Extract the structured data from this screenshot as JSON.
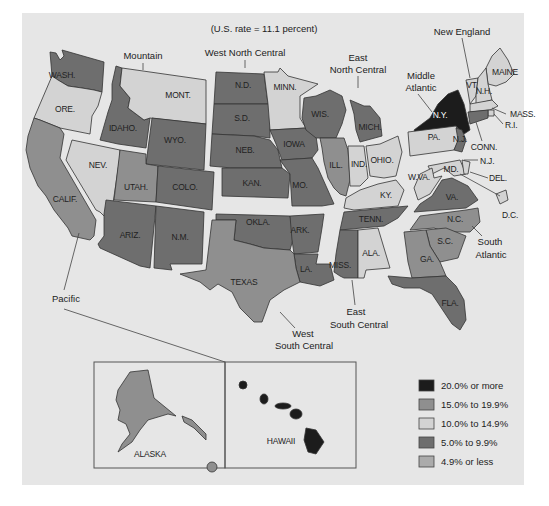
{
  "title": "(U.S. rate = 11.1 percent)",
  "colors": {
    "panel_bg": "#e6e6e6",
    "c20plus": "#1c1c1c",
    "c15to19": "#8f8f8f",
    "c10to14": "#d3d3d3",
    "c5to9": "#6e6e6e",
    "c4less": "#ababab"
  },
  "legend": [
    {
      "key": "c20plus",
      "label": "20.0% or more"
    },
    {
      "key": "c15to19",
      "label": "15.0% to 19.9%"
    },
    {
      "key": "c10to14",
      "label": "10.0% to 14.9%"
    },
    {
      "key": "c5to9",
      "label": "5.0% to 9.9%"
    },
    {
      "key": "c4less",
      "label": "4.9% or less"
    }
  ],
  "regions": {
    "pacific": "Pacific",
    "mountain": "Mountain",
    "west_north_central": "West North Central",
    "east_north_central_1": "East",
    "east_north_central_2": "North Central",
    "middle_atlantic_1": "Middle",
    "middle_atlantic_2": "Atlantic",
    "new_england": "New England",
    "south_atlantic_1": "South",
    "south_atlantic_2": "Atlantic",
    "east_south_central_1": "East",
    "east_south_central_2": "South Central",
    "west_south_central_1": "West",
    "west_south_central_2": "South Central"
  },
  "chart_data": {
    "type": "choropleth",
    "title": "(U.S. rate = 11.1 percent)",
    "us_rate_percent": 11.1,
    "legend_position": "bottom-right",
    "bins": [
      "20.0% or more",
      "15.0% to 19.9%",
      "10.0% to 14.9%",
      "5.0% to 9.9%",
      "4.9% or less"
    ],
    "states": {
      "WASH.": "5.0% to 9.9%",
      "ORE.": "10.0% to 14.9%",
      "CALIF.": "15.0% to 19.9%",
      "NEV.": "10.0% to 14.9%",
      "IDAHO.": "5.0% to 9.9%",
      "MONT.": "10.0% to 14.9%",
      "WYO.": "5.0% to 9.9%",
      "UTAH.": "15.0% to 19.9%",
      "COLO.": "5.0% to 9.9%",
      "ARIZ.": "5.0% to 9.9%",
      "N.M.": "5.0% to 9.9%",
      "N.D.": "5.0% to 9.9%",
      "S.D.": "5.0% to 9.9%",
      "NEB.": "5.0% to 9.9%",
      "KAN.": "5.0% to 9.9%",
      "MINN.": "10.0% to 14.9%",
      "IOWA": "5.0% to 9.9%",
      "MO.": "5.0% to 9.9%",
      "OKLA.": "5.0% to 9.9%",
      "ARK.": "5.0% to 9.9%",
      "LA.": "5.0% to 9.9%",
      "TEXAS": "15.0% to 19.9%",
      "WIS.": "5.0% to 9.9%",
      "MICH.": "5.0% to 9.9%",
      "ILL.": "15.0% to 19.9%",
      "IND.": "10.0% to 14.9%",
      "OHIO.": "10.0% to 14.9%",
      "KY.": "10.0% to 14.9%",
      "TENN.": "5.0% to 9.9%",
      "MISS.": "5.0% to 9.9%",
      "ALA.": "10.0% to 14.9%",
      "N.Y.": "20.0% or more",
      "PA.": "10.0% to 14.9%",
      "N.J.": "5.0% to 9.9%",
      "MAINE": "10.0% to 14.9%",
      "VT.": "10.0% to 14.9%",
      "N.H.": "10.0% to 14.9%",
      "MASS.": "10.0% to 14.9%",
      "R.I.": "10.0% to 14.9%",
      "CONN.": "5.0% to 9.9%",
      "MD.": "10.0% to 14.9%",
      "DEL.": "10.0% to 14.9%",
      "D.C.": "10.0% to 14.9%",
      "W.VA.": "10.0% to 14.9%",
      "VA.": "5.0% to 9.9%",
      "N.C.": "15.0% to 19.9%",
      "S.C.": "15.0% to 19.9%",
      "GA.": "15.0% to 19.9%",
      "FLA.": "5.0% to 9.9%",
      "ALASKA": "15.0% to 19.9%",
      "HAWAII": "20.0% or more"
    }
  },
  "states": [
    {
      "id": "wash",
      "label": "WASH.",
      "fill": "c5to9",
      "lx": 62,
      "ly": 78,
      "pts": "50,52 56,53 60,60 64,56 62,50 104,62 102,92 94,90 82,88 68,86 58,80 52,76"
    },
    {
      "id": "ore",
      "label": "ORE.",
      "fill": "c10to14",
      "lx": 65,
      "ly": 112,
      "pts": "52,76 58,80 68,86 82,88 94,90 102,92 98,106 92,116 90,134 60,128 40,120 34,118 40,104 46,90"
    },
    {
      "id": "calif",
      "label": "CALIF.",
      "fill": "c15to19",
      "lx": 65,
      "ly": 202,
      "pts": "34,118 40,120 60,128 64,134 60,158 96,220 94,236 90,240 72,236 68,228 54,210 46,196 38,186 30,168 26,150 28,136"
    },
    {
      "id": "nev",
      "label": "NEV.",
      "fill": "c10to14",
      "lx": 98,
      "ly": 168,
      "pts": "72,140 120,150 120,156 112,210 108,214 104,216 100,212 96,210 66,160"
    },
    {
      "id": "idaho",
      "label": "IDAHO.",
      "fill": "c5to9",
      "lx": 123,
      "ly": 131,
      "pts": "116,66 122,68 120,86 130,98 128,108 144,120 150,118 146,148 118,144 100,140 104,126 108,112 112,100 112,84"
    },
    {
      "id": "mont",
      "label": "MONT.",
      "fill": "c10to14",
      "lx": 178,
      "ly": 98,
      "pts": "122,68 206,80 206,124 150,118 144,120 128,108 130,98 120,86"
    },
    {
      "id": "wyo",
      "label": "WYO.",
      "fill": "c5to9",
      "lx": 175,
      "ly": 143,
      "pts": "152,118 206,124 204,170 146,164"
    },
    {
      "id": "utah",
      "label": "UTAH.",
      "fill": "c15to19",
      "lx": 136,
      "ly": 190,
      "pts": "120,150 146,154 146,164 158,166 156,202 114,200"
    },
    {
      "id": "colo",
      "label": "COLO.",
      "fill": "c5to9",
      "lx": 185,
      "ly": 190,
      "pts": "158,166 214,172 212,210 156,202"
    },
    {
      "id": "ariz",
      "label": "ARIZ.",
      "fill": "c5to9",
      "lx": 130,
      "ly": 238,
      "pts": "106,200 156,206 150,268 140,266 100,248 98,244 104,236 104,214"
    },
    {
      "id": "nm",
      "label": "N.M.",
      "fill": "c5to9",
      "lx": 180,
      "ly": 240,
      "pts": "156,206 204,212 202,264 170,264 172,270 154,268"
    },
    {
      "id": "nd",
      "label": "N.D.",
      "fill": "c5to9",
      "lx": 243,
      "ly": 88,
      "pts": "216,72 264,74 268,104 214,104"
    },
    {
      "id": "sd",
      "label": "S.D.",
      "fill": "c5to9",
      "lx": 242,
      "ly": 121,
      "pts": "214,104 270,104 270,138 254,136 212,134"
    },
    {
      "id": "neb",
      "label": "NEB.",
      "fill": "c5to9",
      "lx": 245,
      "ly": 153,
      "pts": "212,134 254,136 270,140 278,150 282,168 232,168 210,166"
    },
    {
      "id": "kan",
      "label": "KAN.",
      "fill": "c5to9",
      "lx": 252,
      "ly": 186,
      "pts": "222,168 282,168 290,174 288,198 222,196"
    },
    {
      "id": "minn",
      "label": "MINN.",
      "fill": "c10to14",
      "lx": 285,
      "ly": 90,
      "pts": "264,72 278,72 280,68 288,76 318,84 300,96 300,118 306,128 270,130 268,104"
    },
    {
      "id": "iowa",
      "label": "IOWA",
      "fill": "c5to9",
      "lx": 294,
      "ly": 147,
      "pts": "270,130 306,128 316,136 318,150 312,158 282,160 276,144"
    },
    {
      "id": "mo",
      "label": "MO.",
      "fill": "c5to9",
      "lx": 300,
      "ly": 188,
      "pts": "280,160 312,158 318,168 326,186 334,204 322,206 292,206 290,174"
    },
    {
      "id": "okla",
      "label": "OKLA.",
      "fill": "c5to9",
      "lx": 258,
      "ly": 225,
      "pts": "216,214 290,216 294,236 290,250 264,248 250,244 234,240 236,220 216,220"
    },
    {
      "id": "ark",
      "label": "ARK.",
      "fill": "c5to9",
      "lx": 300,
      "ly": 233,
      "pts": "290,216 324,214 322,228 318,252 294,254 292,240"
    },
    {
      "id": "la",
      "label": "LA.",
      "fill": "c5to9",
      "lx": 306,
      "ly": 272,
      "pts": "294,254 318,254 316,264 330,264 334,280 320,286 300,282 296,268"
    },
    {
      "id": "texas",
      "label": "TEXAS",
      "fill": "c15to19",
      "lx": 244,
      "ly": 285,
      "pts": "212,220 236,220 234,240 250,244 264,248 290,250 294,254 296,268 300,282 284,290 270,300 262,322 254,322 240,308 232,292 218,284 210,290 200,282 180,274 206,270"
    },
    {
      "id": "wis",
      "label": "WIS.",
      "fill": "c5to9",
      "lx": 320,
      "ly": 117,
      "pts": "304,98 316,96 330,90 342,96 346,110 342,124 336,138 316,138 306,130 302,118"
    },
    {
      "id": "mich",
      "label": "MICH.",
      "fill": "c5to9",
      "lx": 370,
      "ly": 130,
      "pts": "350,100 364,106 370,106 380,118 382,136 360,142 356,130 354,114"
    },
    {
      "id": "ill",
      "label": "ILL.",
      "fill": "c15to19",
      "lx": 336,
      "ly": 168,
      "pts": "320,138 344,138 348,150 350,180 346,196 340,194 334,188 328,178 324,162 322,148"
    },
    {
      "id": "ind",
      "label": "IND.",
      "fill": "c10to14",
      "lx": 359,
      "ly": 167,
      "pts": "348,146 364,146 368,178 360,186 350,186"
    },
    {
      "id": "ohio",
      "label": "OHIO.",
      "fill": "c10to14",
      "lx": 382,
      "ly": 163,
      "pts": "366,146 380,144 398,136 402,152 396,176 384,178 370,176"
    },
    {
      "id": "ky",
      "label": "KY.",
      "fill": "c10to14",
      "lx": 386,
      "ly": 198,
      "pts": "346,198 360,190 378,184 396,180 404,190 398,206 354,210 344,208"
    },
    {
      "id": "tenn",
      "label": "TENN.",
      "fill": "c5to9",
      "lx": 371,
      "ly": 222,
      "pts": "344,212 408,206 398,218 384,226 340,230"
    },
    {
      "id": "miss",
      "label": "MISS.",
      "fill": "c5to9",
      "lx": 340,
      "ly": 268,
      "pts": "340,230 358,230 358,278 344,278 340,276 334,272 336,254"
    },
    {
      "id": "ala",
      "label": "ALA.",
      "fill": "c10to14",
      "lx": 371,
      "ly": 256,
      "pts": "358,230 378,228 390,268 366,270 364,278 358,278"
    },
    {
      "id": "ny",
      "label": "N.Y.",
      "fill": "c20plus",
      "lx": 440,
      "ly": 118,
      "pts": "414,130 430,118 438,104 448,94 458,90 464,104 470,130 464,134 456,126 416,134"
    },
    {
      "id": "pa",
      "label": "PA.",
      "fill": "c10to14",
      "lx": 434,
      "ly": 140,
      "pts": "408,132 456,126 460,138 454,150 410,156"
    },
    {
      "id": "nj",
      "label": "N.J.",
      "fill": "c5to9",
      "lx": 460,
      "ly": 142,
      "pts": "456,128 462,130 466,140 462,152 454,150 458,140"
    },
    {
      "id": "maine",
      "label": "MAINE",
      "fill": "c10to14",
      "lx": 505,
      "ly": 75,
      "pts": "492,56 500,48 508,60 514,74 506,82 496,86 488,84 486,68"
    },
    {
      "id": "vt",
      "label": "VT.",
      "fill": "c10to14",
      "lx": 472,
      "ly": 88,
      "pts": "466,80 478,78 476,96 470,104 468,92"
    },
    {
      "id": "nh",
      "label": "N.H.",
      "fill": "c10to14",
      "lx": 484,
      "ly": 94,
      "pts": "478,78 486,68 488,84 492,100 476,104 476,96"
    },
    {
      "id": "mass",
      "label": "MASS.",
      "fill": "c10to14",
      "lx": 0,
      "ly": 0,
      "pts": "470,104 492,100 498,106 490,110 470,112"
    },
    {
      "id": "ri",
      "label": "R.I.",
      "fill": "c10to14",
      "lx": 0,
      "ly": 0,
      "pts": "488,110 494,110 494,116 488,116"
    },
    {
      "id": "conn",
      "label": "CONN.",
      "fill": "c5to9",
      "lx": 0,
      "ly": 0,
      "pts": "468,112 488,110 488,118 470,124"
    },
    {
      "id": "md",
      "label": "MD.",
      "fill": "c10to14",
      "lx": 0,
      "ly": 0,
      "pts": "428,166 460,160 466,174 454,176 444,168 432,174"
    },
    {
      "id": "del",
      "label": "DEL.",
      "fill": "c10to14",
      "lx": 0,
      "ly": 0,
      "pts": "462,160 470,162 468,174 464,174"
    },
    {
      "id": "dc",
      "label": "D.C.",
      "fill": "c10to14",
      "lx": 0,
      "ly": 0,
      "pts": "496,194 506,190 508,200 500,204"
    },
    {
      "id": "wva",
      "label": "W.VA.",
      "fill": "c10to14",
      "lx": 0,
      "ly": 0,
      "pts": "420,174 432,168 434,178 442,176 430,194 418,200 414,188"
    },
    {
      "id": "va",
      "label": "VA.",
      "fill": "c5to9",
      "lx": 452,
      "ly": 200,
      "pts": "414,212 420,204 432,196 442,180 452,178 468,186 478,200 466,208"
    },
    {
      "id": "nc",
      "label": "N.C.",
      "fill": "c15to19",
      "lx": 455,
      "ly": 222,
      "pts": "410,230 420,216 466,210 478,208 480,222 470,232 446,232 434,228"
    },
    {
      "id": "sc",
      "label": "S.C.",
      "fill": "c15to19",
      "lx": 445,
      "ly": 244,
      "pts": "426,230 446,228 466,236 458,258 440,262 430,246"
    },
    {
      "id": "ga",
      "label": "GA.",
      "fill": "c15to19",
      "lx": 427,
      "ly": 262,
      "pts": "404,232 426,230 430,246 440,262 446,276 412,278 408,262"
    },
    {
      "id": "fla",
      "label": "FLA.",
      "fill": "c5to9",
      "lx": 450,
      "ly": 306,
      "pts": "388,276 412,278 446,276 456,286 464,300 466,320 460,330 452,324 440,306 432,294 420,288 404,288 392,284"
    }
  ],
  "inset": {
    "alaska_label": "ALASKA",
    "hawaii_label": "HAWAII"
  }
}
